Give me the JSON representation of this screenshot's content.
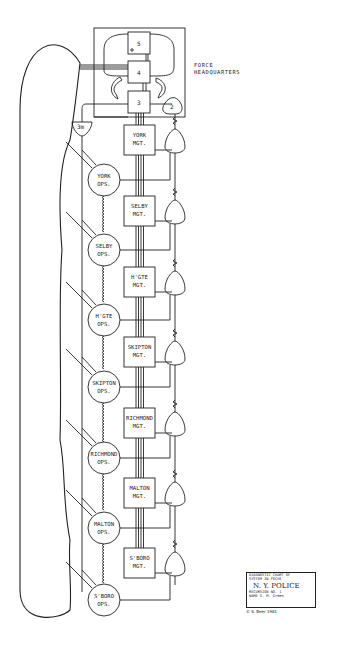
{
  "headquarters": {
    "label_line1": "FORCE",
    "label_line2": "HEADQUARTERS",
    "systems": [
      "5",
      "4",
      "3",
      "2"
    ],
    "system_3m": "3m"
  },
  "divisions": [
    {
      "mgt_line1": "YORK",
      "mgt_line2": "MGT.",
      "ops_line1": "YORK",
      "ops_line2": "OPS."
    },
    {
      "mgt_line1": "SELBY",
      "mgt_line2": "MGT.",
      "ops_line1": "SELBY",
      "ops_line2": "OPS."
    },
    {
      "mgt_line1": "H'GTE",
      "mgt_line2": "MGT.",
      "ops_line1": "H'GTE",
      "ops_line2": "OPS."
    },
    {
      "mgt_line1": "SKIPTON",
      "mgt_line2": "MGT.",
      "ops_line1": "SKIPTON",
      "ops_line2": "OPS."
    },
    {
      "mgt_line1": "RICHMOND",
      "mgt_line2": "MGT.",
      "ops_line1": "RICHMOND",
      "ops_line2": "OPS."
    },
    {
      "mgt_line1": "MALTON",
      "mgt_line2": "MGT.",
      "ops_line1": "MALTON",
      "ops_line2": "OPS."
    },
    {
      "mgt_line1": "S'BORO",
      "mgt_line2": "MGT.",
      "ops_line1": "S'BORO",
      "ops_line2": "OPS."
    }
  ],
  "card": {
    "line1": "DIAGNOSTIC CHART OF",
    "line2": "SYSTEM IN FOCUS",
    "system_name": "N. Y. POLICE",
    "recursion_label": "RECURSION NO.",
    "recursion_value": "1",
    "name_label": "NAME",
    "name_value": "S. M. Green"
  },
  "copyright": "© S. Beer 1981",
  "colors": {
    "ink": "#222222",
    "background": "#ffffff"
  }
}
